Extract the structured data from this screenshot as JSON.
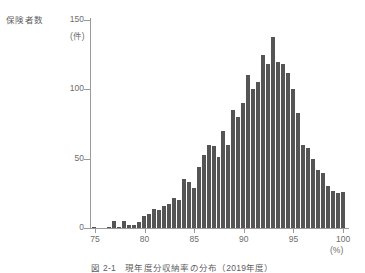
{
  "figure": {
    "caption": "図 2-1　現年度分収納率の分布（2019年度）",
    "bar_color": "#555555",
    "axis_color": "#9a9a9a",
    "text_color": "#6d6d6d"
  },
  "axes": {
    "y_label": "保険者数",
    "y_unit": "(件)",
    "x_unit": "(%)",
    "y_ticks": [
      {
        "value": 150,
        "label": "150"
      },
      {
        "value": 100,
        "label": "100"
      },
      {
        "value": 50,
        "label": "50"
      },
      {
        "value": 0,
        "label": "0"
      }
    ],
    "x_ticks": [
      {
        "value": 75,
        "label": "75"
      },
      {
        "value": 80,
        "label": "80"
      },
      {
        "value": 85,
        "label": "85"
      },
      {
        "value": 90,
        "label": "90"
      },
      {
        "value": 95,
        "label": "95"
      },
      {
        "value": 100,
        "label": "100"
      }
    ]
  },
  "chart_data": {
    "type": "bar",
    "title": "図 2-1　現年度分収納率の分布（2019年度）",
    "xlabel": "(%)",
    "ylabel": "保険者数 (件)",
    "xlim": [
      74.5,
      100.5
    ],
    "ylim": [
      0,
      150
    ],
    "grid": false,
    "legend": "none",
    "bin_width": 0.5,
    "categories": [
      "75.0",
      "75.5",
      "76.0",
      "76.5",
      "77.0",
      "77.5",
      "78.0",
      "78.5",
      "79.0",
      "79.5",
      "80.0",
      "80.5",
      "81.0",
      "81.5",
      "82.0",
      "82.5",
      "83.0",
      "83.5",
      "84.0",
      "84.5",
      "85.0",
      "85.5",
      "86.0",
      "86.5",
      "87.0",
      "87.5",
      "88.0",
      "88.5",
      "89.0",
      "89.5",
      "90.0",
      "90.5",
      "91.0",
      "91.5",
      "92.0",
      "92.5",
      "93.0",
      "93.5",
      "94.0",
      "94.5",
      "95.0",
      "95.5",
      "96.0",
      "96.5",
      "97.0",
      "97.5",
      "98.0",
      "98.5",
      "99.0",
      "99.5",
      "100.0"
    ],
    "values": [
      1,
      0,
      0,
      1,
      5,
      1,
      5,
      2,
      2,
      4,
      9,
      10,
      14,
      13,
      16,
      17,
      22,
      20,
      35,
      33,
      29,
      44,
      53,
      60,
      59,
      51,
      70,
      60,
      85,
      80,
      90,
      110,
      100,
      105,
      125,
      118,
      138,
      120,
      118,
      112,
      100,
      83,
      60,
      58,
      50,
      42,
      40,
      30,
      27,
      25,
      26
    ]
  }
}
